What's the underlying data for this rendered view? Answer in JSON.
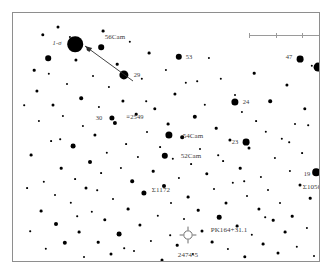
{
  "chart": {
    "frame": {
      "x": 12,
      "y": 12,
      "width": 308,
      "height": 250,
      "border_color": "#8e8e8e"
    },
    "background_color": "#ffffff",
    "star_color": "#000000",
    "label_color": "#3b3b3b"
  },
  "scale_bar": {
    "name": "scale-bar",
    "x": 236,
    "y": 22,
    "width": 80,
    "ticks": [
      0,
      26.6,
      53.3,
      80
    ],
    "color": "#9a9a9a"
  },
  "labels": [
    {
      "id": "one-sigma",
      "text": "1-σ",
      "x": 44,
      "y": 30,
      "size": 6.5,
      "style": "italic"
    },
    {
      "id": "56cam",
      "text": "56Cam",
      "x": 102,
      "y": 24,
      "size": 7
    },
    {
      "id": "53",
      "text": "53",
      "x": 176,
      "y": 44,
      "size": 6.5
    },
    {
      "id": "47",
      "text": "47",
      "x": 276,
      "y": 44,
      "size": 6.5
    },
    {
      "id": "18",
      "text": "18",
      "x": 316,
      "y": 58,
      "size": 6.5
    },
    {
      "id": "29",
      "text": "29",
      "x": 124,
      "y": 62,
      "size": 6.5
    },
    {
      "id": "30",
      "text": "30",
      "x": 86,
      "y": 105,
      "size": 6.5
    },
    {
      "id": "2549",
      "text": "≡2549",
      "x": 122,
      "y": 104,
      "size": 6.5
    },
    {
      "id": "24",
      "text": "24",
      "x": 233,
      "y": 89,
      "size": 6.5
    },
    {
      "id": "54cam",
      "text": "54Cam",
      "x": 180,
      "y": 123,
      "size": 7
    },
    {
      "id": "23",
      "text": "23",
      "x": 222,
      "y": 129,
      "size": 6.5
    },
    {
      "id": "52cam",
      "text": "52Cam",
      "x": 178,
      "y": 143,
      "size": 7
    },
    {
      "id": "sigma1172",
      "text": "Σ1172",
      "x": 148,
      "y": 177,
      "size": 7
    },
    {
      "id": "19",
      "text": "19",
      "x": 294,
      "y": 161,
      "size": 6.5
    },
    {
      "id": "sigma1050",
      "text": "Σ1050",
      "x": 299,
      "y": 174,
      "size": 7
    },
    {
      "id": "pk164",
      "text": "PK164+31.1",
      "x": 216,
      "y": 217,
      "size": 7
    },
    {
      "id": "2474-5",
      "text": "2474-5",
      "x": 175,
      "y": 242,
      "size": 7
    }
  ],
  "annotations": {
    "arrow": {
      "name": "pointer-arrow",
      "from_x": 120,
      "from_y": 68,
      "to_x": 72,
      "to_y": 33,
      "color": "#2e2e2e"
    },
    "planetary_nebula": {
      "name": "planetary-nebula-symbol",
      "x": 175,
      "y": 222,
      "radius": 5,
      "color": "#6d6d6d"
    }
  },
  "chart_data": {
    "type": "scatter",
    "xlabel": "",
    "ylabel": "",
    "xlim": [
      0,
      308
    ],
    "ylim": [
      0,
      250
    ],
    "grid": false,
    "legend": "none",
    "note": "Positions in frame-local pixels; r = plotted radius proportional to stellar brightness.",
    "stars": [
      {
        "x": 18,
        "y": 142,
        "r": 1.4
      },
      {
        "x": 21,
        "y": 57,
        "r": 1.3
      },
      {
        "x": 24,
        "y": 78,
        "r": 1.6
      },
      {
        "x": 26,
        "y": 108,
        "r": 1.1
      },
      {
        "x": 28,
        "y": 198,
        "r": 1.4
      },
      {
        "x": 30,
        "y": 22,
        "r": 1.7
      },
      {
        "x": 31,
        "y": 169,
        "r": 1.2
      },
      {
        "x": 33,
        "y": 236,
        "r": 1.2
      },
      {
        "x": 35,
        "y": 45,
        "r": 2.8
      },
      {
        "x": 36,
        "y": 61,
        "r": 1.2
      },
      {
        "x": 38,
        "y": 128,
        "r": 0.9
      },
      {
        "x": 40,
        "y": 92,
        "r": 1.5
      },
      {
        "x": 42,
        "y": 182,
        "r": 1.0
      },
      {
        "x": 43,
        "y": 211,
        "r": 2.0
      },
      {
        "x": 45,
        "y": 14,
        "r": 1.5
      },
      {
        "x": 48,
        "y": 155,
        "r": 1.3
      },
      {
        "x": 50,
        "y": 103,
        "r": 1.1
      },
      {
        "x": 52,
        "y": 230,
        "r": 2.2
      },
      {
        "x": 54,
        "y": 71,
        "r": 1.0
      },
      {
        "x": 57,
        "y": 24,
        "r": 1.1
      },
      {
        "x": 58,
        "y": 190,
        "r": 1.2
      },
      {
        "x": 60,
        "y": 133,
        "r": 2.4
      },
      {
        "x": 62,
        "y": 166,
        "r": 0.9
      },
      {
        "x": 63,
        "y": 47,
        "r": 1.6
      },
      {
        "x": 66,
        "y": 219,
        "r": 1.4
      },
      {
        "x": 68,
        "y": 85,
        "r": 1.8
      },
      {
        "x": 70,
        "y": 113,
        "r": 1.1
      },
      {
        "x": 71,
        "y": 244,
        "r": 1.0
      },
      {
        "x": 73,
        "y": 175,
        "r": 1.5
      },
      {
        "x": 75,
        "y": 36,
        "r": 1.3
      },
      {
        "x": 77,
        "y": 149,
        "r": 2.0
      },
      {
        "x": 79,
        "y": 199,
        "r": 1.2
      },
      {
        "x": 80,
        "y": 63,
        "r": 1.0
      },
      {
        "x": 82,
        "y": 122,
        "r": 1.6
      },
      {
        "x": 85,
        "y": 229,
        "r": 1.3
      },
      {
        "x": 86,
        "y": 94,
        "r": 1.1
      },
      {
        "x": 88,
        "y": 160,
        "r": 0.9
      },
      {
        "x": 90,
        "y": 18,
        "r": 1.4
      },
      {
        "x": 92,
        "y": 207,
        "r": 1.7
      },
      {
        "x": 94,
        "y": 140,
        "r": 1.2
      },
      {
        "x": 96,
        "y": 74,
        "r": 1.1
      },
      {
        "x": 98,
        "y": 241,
        "r": 1.5
      },
      {
        "x": 100,
        "y": 186,
        "r": 1.0
      },
      {
        "x": 102,
        "y": 110,
        "r": 2.1
      },
      {
        "x": 104,
        "y": 51,
        "r": 1.3
      },
      {
        "x": 106,
        "y": 221,
        "r": 2.4
      },
      {
        "x": 108,
        "y": 155,
        "r": 1.1
      },
      {
        "x": 110,
        "y": 88,
        "r": 1.6
      },
      {
        "x": 113,
        "y": 131,
        "r": 0.9
      },
      {
        "x": 115,
        "y": 196,
        "r": 1.4
      },
      {
        "x": 117,
        "y": 29,
        "r": 1.2
      },
      {
        "x": 119,
        "y": 168,
        "r": 1.8
      },
      {
        "x": 121,
        "y": 238,
        "r": 1.0
      },
      {
        "x": 123,
        "y": 101,
        "r": 1.3
      },
      {
        "x": 125,
        "y": 144,
        "r": 1.1
      },
      {
        "x": 127,
        "y": 212,
        "r": 1.6
      },
      {
        "x": 129,
        "y": 66,
        "r": 1.2
      },
      {
        "x": 131,
        "y": 180,
        "r": 2.6
      },
      {
        "x": 134,
        "y": 119,
        "r": 1.0
      },
      {
        "x": 136,
        "y": 40,
        "r": 1.4
      },
      {
        "x": 138,
        "y": 228,
        "r": 1.1
      },
      {
        "x": 140,
        "y": 158,
        "r": 1.3
      },
      {
        "x": 142,
        "y": 96,
        "r": 1.7
      },
      {
        "x": 145,
        "y": 203,
        "r": 1.2
      },
      {
        "x": 147,
        "y": 134,
        "r": 0.9
      },
      {
        "x": 149,
        "y": 247,
        "r": 1.5
      },
      {
        "x": 151,
        "y": 173,
        "r": 2.0
      },
      {
        "x": 153,
        "y": 57,
        "r": 1.1
      },
      {
        "x": 155,
        "y": 111,
        "r": 1.4
      },
      {
        "x": 158,
        "y": 190,
        "r": 1.0
      },
      {
        "x": 160,
        "y": 146,
        "r": 1.2
      },
      {
        "x": 162,
        "y": 81,
        "r": 1.6
      },
      {
        "x": 164,
        "y": 232,
        "r": 1.3
      },
      {
        "x": 166,
        "y": 165,
        "r": 1.1
      },
      {
        "x": 169,
        "y": 124,
        "r": 1.8
      },
      {
        "x": 171,
        "y": 206,
        "r": 1.0
      },
      {
        "x": 173,
        "y": 70,
        "r": 1.2
      },
      {
        "x": 175,
        "y": 184,
        "r": 1.4
      },
      {
        "x": 178,
        "y": 151,
        "r": 0.9
      },
      {
        "x": 180,
        "y": 241,
        "r": 1.1
      },
      {
        "x": 182,
        "y": 104,
        "r": 2.2
      },
      {
        "x": 185,
        "y": 197,
        "r": 1.3
      },
      {
        "x": 187,
        "y": 136,
        "r": 1.0
      },
      {
        "x": 189,
        "y": 218,
        "r": 1.5
      },
      {
        "x": 192,
        "y": 92,
        "r": 1.2
      },
      {
        "x": 194,
        "y": 161,
        "r": 1.7
      },
      {
        "x": 196,
        "y": 45,
        "r": 1.1
      },
      {
        "x": 199,
        "y": 229,
        "r": 1.4
      },
      {
        "x": 201,
        "y": 176,
        "r": 1.0
      },
      {
        "x": 203,
        "y": 115,
        "r": 1.3
      },
      {
        "x": 206,
        "y": 204,
        "r": 2.3
      },
      {
        "x": 208,
        "y": 66,
        "r": 1.2
      },
      {
        "x": 210,
        "y": 148,
        "r": 0.9
      },
      {
        "x": 213,
        "y": 190,
        "r": 1.5
      },
      {
        "x": 215,
        "y": 236,
        "r": 1.1
      },
      {
        "x": 217,
        "y": 127,
        "r": 1.6
      },
      {
        "x": 220,
        "y": 170,
        "r": 1.2
      },
      {
        "x": 222,
        "y": 82,
        "r": 1.0
      },
      {
        "x": 224,
        "y": 213,
        "r": 1.4
      },
      {
        "x": 227,
        "y": 155,
        "r": 1.3
      },
      {
        "x": 229,
        "y": 99,
        "r": 1.1
      },
      {
        "x": 232,
        "y": 244,
        "r": 1.7
      },
      {
        "x": 234,
        "y": 183,
        "r": 1.0
      },
      {
        "x": 236,
        "y": 135,
        "r": 1.5
      },
      {
        "x": 239,
        "y": 222,
        "r": 1.2
      },
      {
        "x": 241,
        "y": 60,
        "r": 1.3
      },
      {
        "x": 243,
        "y": 108,
        "r": 0.9
      },
      {
        "x": 246,
        "y": 196,
        "r": 1.6
      },
      {
        "x": 248,
        "y": 164,
        "r": 1.1
      },
      {
        "x": 250,
        "y": 231,
        "r": 1.4
      },
      {
        "x": 253,
        "y": 119,
        "r": 1.2
      },
      {
        "x": 255,
        "y": 177,
        "r": 1.0
      },
      {
        "x": 257,
        "y": 88,
        "r": 1.8
      },
      {
        "x": 260,
        "y": 207,
        "r": 1.3
      },
      {
        "x": 262,
        "y": 145,
        "r": 1.1
      },
      {
        "x": 265,
        "y": 240,
        "r": 1.5
      },
      {
        "x": 267,
        "y": 190,
        "r": 1.0
      },
      {
        "x": 269,
        "y": 126,
        "r": 1.2
      },
      {
        "x": 272,
        "y": 219,
        "r": 1.4
      },
      {
        "x": 274,
        "y": 72,
        "r": 1.6
      },
      {
        "x": 277,
        "y": 158,
        "r": 1.1
      },
      {
        "x": 279,
        "y": 203,
        "r": 1.3
      },
      {
        "x": 282,
        "y": 111,
        "r": 1.0
      },
      {
        "x": 284,
        "y": 234,
        "r": 1.2
      },
      {
        "x": 287,
        "y": 172,
        "r": 1.5
      },
      {
        "x": 289,
        "y": 140,
        "r": 0.9
      },
      {
        "x": 292,
        "y": 96,
        "r": 1.7
      },
      {
        "x": 294,
        "y": 215,
        "r": 1.1
      },
      {
        "x": 297,
        "y": 185,
        "r": 1.3
      },
      {
        "x": 299,
        "y": 53,
        "r": 1.2
      },
      {
        "x": 301,
        "y": 243,
        "r": 1.0
      },
      {
        "x": 11,
        "y": 92,
        "r": 0.8
      },
      {
        "x": 14,
        "y": 175,
        "r": 0.9
      },
      {
        "x": 17,
        "y": 218,
        "r": 0.8
      },
      {
        "x": 47,
        "y": 126,
        "r": 0.8
      },
      {
        "x": 64,
        "y": 203,
        "r": 0.8
      },
      {
        "x": 84,
        "y": 177,
        "r": 0.8
      },
      {
        "x": 111,
        "y": 235,
        "r": 0.8
      },
      {
        "x": 133,
        "y": 88,
        "r": 0.8
      },
      {
        "x": 157,
        "y": 222,
        "r": 0.8
      },
      {
        "x": 184,
        "y": 68,
        "r": 0.8
      },
      {
        "x": 205,
        "y": 142,
        "r": 0.8
      },
      {
        "x": 231,
        "y": 168,
        "r": 0.8
      },
      {
        "x": 252,
        "y": 204,
        "r": 0.8
      },
      {
        "x": 276,
        "y": 129,
        "r": 0.8
      },
      {
        "x": 295,
        "y": 112,
        "r": 0.8
      }
    ],
    "named_stars": [
      {
        "label": "1-σ",
        "x": 62,
        "y": 31,
        "r": 7.8,
        "name": "alpha-cam-primary"
      },
      {
        "label": "56Cam",
        "x": 88,
        "y": 34,
        "r": 2.8
      },
      {
        "label": "53",
        "x": 166,
        "y": 44,
        "r": 3.2
      },
      {
        "label": "47",
        "x": 287,
        "y": 46,
        "r": 3.4
      },
      {
        "label": "18",
        "x": 305,
        "y": 54,
        "r": 4.4
      },
      {
        "label": "29",
        "x": 111,
        "y": 62,
        "r": 4.6
      },
      {
        "label": "30",
        "x": 99,
        "y": 105,
        "r": 2.6
      },
      {
        "label": "24",
        "x": 222,
        "y": 89,
        "r": 3.6
      },
      {
        "label": "54Cam",
        "x": 156,
        "y": 122,
        "r": 3.6
      },
      {
        "label": "23",
        "x": 233,
        "y": 129,
        "r": 3.4
      },
      {
        "label": "52Cam",
        "x": 152,
        "y": 143,
        "r": 3.2
      },
      {
        "label": "19",
        "x": 303,
        "y": 159,
        "r": 3.8
      }
    ]
  }
}
